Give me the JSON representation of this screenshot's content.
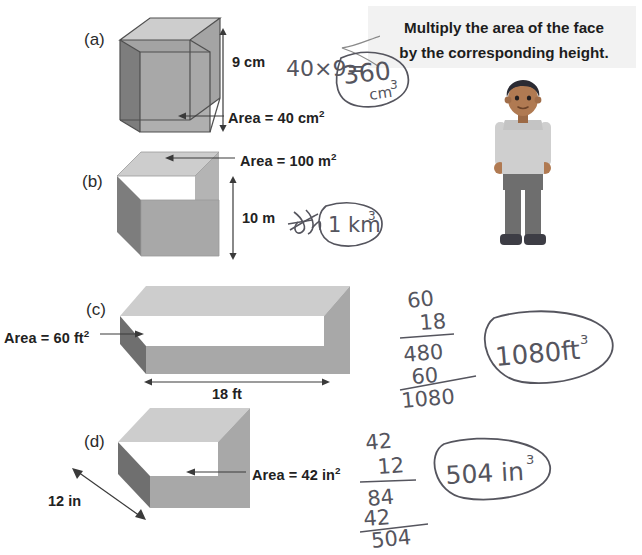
{
  "speech_bubble": {
    "line1": "Multiply the area of the face",
    "line2": "by the corresponding height."
  },
  "problems": [
    {
      "letter": "(a)",
      "shape": "transparent-cube",
      "labels": {
        "height": "9 cm",
        "area": "Area = 40 cm",
        "area_exp": "2"
      },
      "work": {
        "expression": "40×9=",
        "answer": "360",
        "answer_unit": "cm",
        "answer_exp": "3",
        "circled": true
      }
    },
    {
      "letter": "(b)",
      "shape": "solid-cube",
      "labels": {
        "height": "10 m",
        "area": "Area = 100 m",
        "area_exp": "2"
      },
      "work": {
        "scribble": "crossed-out attempt",
        "answer": "1 km",
        "answer_exp": "3",
        "circled": true
      }
    },
    {
      "letter": "(c)",
      "shape": "wide-prism",
      "labels": {
        "length": "18 ft",
        "area": "Area = 60 ft",
        "area_exp": "2"
      },
      "work": {
        "multiplicand": "60",
        "multiplier": "18",
        "partial1": "480",
        "partial2": "60",
        "total": "1080",
        "answer": "1080ft",
        "answer_exp": "3",
        "circled": true
      }
    },
    {
      "letter": "(d)",
      "shape": "short-prism",
      "labels": {
        "depth": "12 in",
        "area": "Area = 42 in",
        "area_exp": "2"
      },
      "work": {
        "multiplicand": "42",
        "multiplier": "12",
        "partial1": "84",
        "partial2": "42",
        "total": "504",
        "answer": "504 in",
        "answer_exp": "3",
        "circled": true
      }
    }
  ],
  "colors": {
    "face_front": "#a8a8a8",
    "face_left_dark": "#7d7d7d",
    "face_top_light": "#cfcfcf",
    "edge": "#4a4a4a",
    "bubble_bg": "#f2f2f2",
    "ink": "#4a4a52",
    "skin": "#b07a52",
    "hair": "#2b2b33",
    "shirt": "#cfcfcf",
    "pants": "#6e6e6e",
    "shoes": "#3d3d45"
  }
}
